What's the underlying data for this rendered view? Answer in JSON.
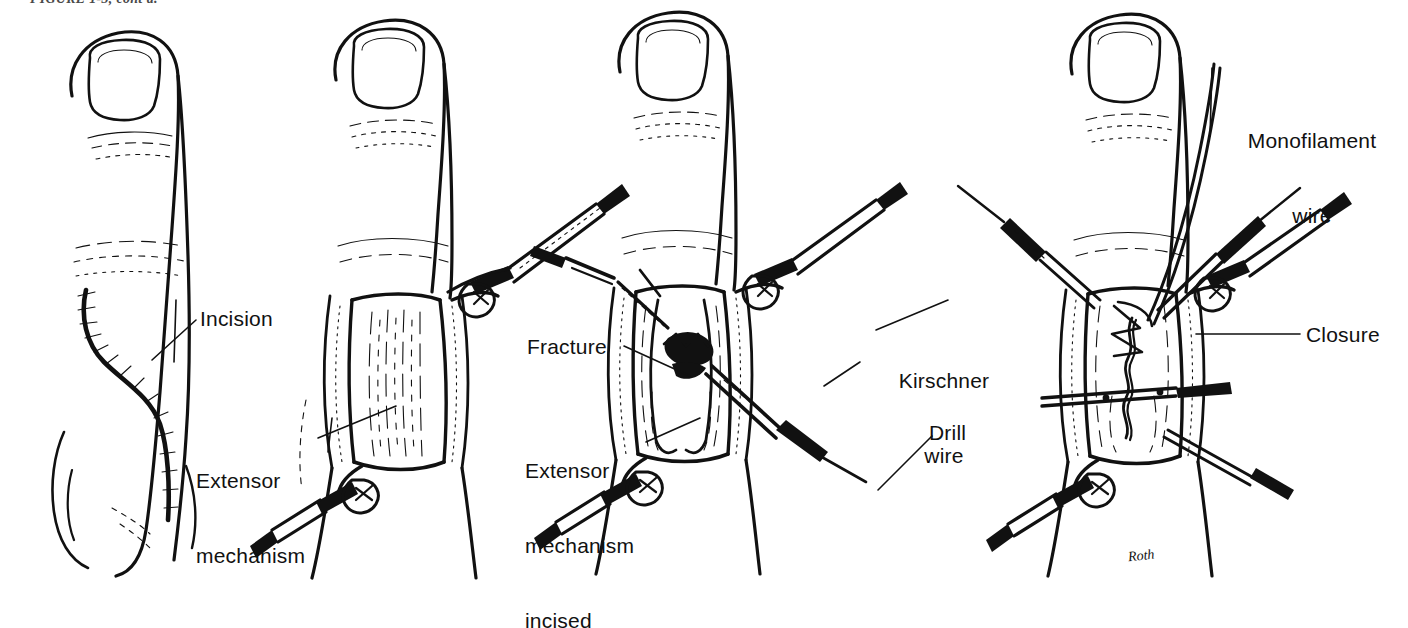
{
  "figure": {
    "caption_fragment": "FIGURE 1-3, cont'd.",
    "artist_signature": "Roth",
    "background_color": "#ffffff",
    "ink_color": "#111111",
    "width": 1408,
    "height": 628,
    "panel_count": 4
  },
  "panels": [
    {
      "id": "panel-a",
      "title": "Incision",
      "description": "Dorsal view of finger with marked surgical incision",
      "labels": [
        {
          "name": "incision",
          "lines": [
            "Incision"
          ],
          "x": 200,
          "y": 306,
          "align": "left"
        }
      ]
    },
    {
      "id": "panel-b",
      "title": "Extensor mechanism exposed",
      "description": "Finger with skin flaps retracted by skin hooks exposing extensor mechanism",
      "labels": [
        {
          "name": "extensor-mechanism",
          "lines": [
            "Extensor",
            "mechanism"
          ],
          "x": 196,
          "y": 418,
          "align": "left"
        }
      ]
    },
    {
      "id": "panel-c",
      "title": "Fracture exposed, Kirschner wire and drill",
      "description": "Extensor mechanism incised revealing fracture; Kirschner wire and drill in place",
      "labels": [
        {
          "name": "fracture",
          "lines": [
            "Fracture"
          ],
          "x": 527,
          "y": 334,
          "align": "left"
        },
        {
          "name": "extensor-mechanism-incised",
          "lines": [
            "Extensor",
            "mechanism",
            "incised"
          ],
          "x": 525,
          "y": 408,
          "align": "left"
        },
        {
          "name": "kirschner-wire",
          "lines": [
            "Kirschner",
            "wire"
          ],
          "x": 884,
          "y": 318,
          "align": "center"
        },
        {
          "name": "drill",
          "lines": [
            "Drill"
          ],
          "x": 929,
          "y": 420,
          "align": "left"
        }
      ]
    },
    {
      "id": "panel-d",
      "title": "Monofilament wire closure",
      "description": "Fracture fixed with monofilament wire and extensor mechanism closed",
      "labels": [
        {
          "name": "monofilament-wire",
          "lines": [
            "Monofilament",
            "wire"
          ],
          "x": 1237,
          "y": 78,
          "align": "center"
        },
        {
          "name": "closure",
          "lines": [
            "Closure"
          ],
          "x": 1306,
          "y": 322,
          "align": "left"
        }
      ]
    }
  ]
}
